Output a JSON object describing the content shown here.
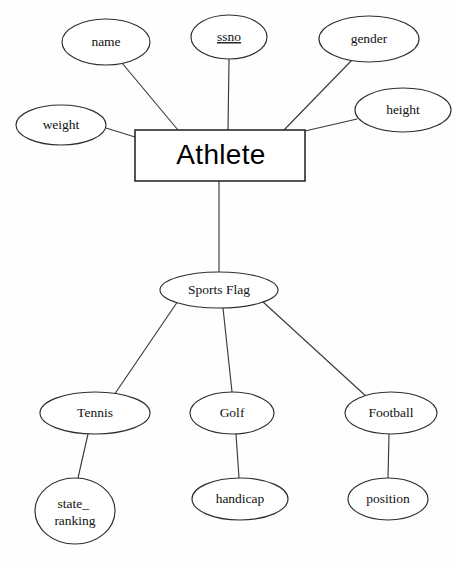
{
  "diagram": {
    "type": "entity-relationship-diagram",
    "background_color": "#fefefe",
    "line_color": "#3a3a3a",
    "node_fill": "#ffffff",
    "node_stroke": "#2e2e2e"
  },
  "entities": [
    {
      "id": "athlete",
      "label": "Athlete",
      "shape": "rectangle",
      "x": 135,
      "y": 130,
      "width": 170,
      "height": 51,
      "font": "sans-serif",
      "font_size": 28
    }
  ],
  "relationships": [
    {
      "id": "sports-flag",
      "label": "Sports Flag",
      "shape": "ellipse",
      "cx": 219,
      "cy": 290,
      "rx": 59,
      "ry": 18
    }
  ],
  "attributes": [
    {
      "id": "name",
      "label": "name",
      "parent": "athlete",
      "is_key": false,
      "cx": 106,
      "cy": 42,
      "rx": 44,
      "ry": 23
    },
    {
      "id": "ssno",
      "label": "ssno",
      "parent": "athlete",
      "is_key": true,
      "cx": 229,
      "cy": 37,
      "rx": 38,
      "ry": 22
    },
    {
      "id": "gender",
      "label": "gender",
      "parent": "athlete",
      "is_key": false,
      "cx": 369,
      "cy": 39,
      "rx": 50,
      "ry": 23
    },
    {
      "id": "weight",
      "label": "weight",
      "parent": "athlete",
      "is_key": false,
      "cx": 61,
      "cy": 125,
      "rx": 45,
      "ry": 20
    },
    {
      "id": "height",
      "label": "height",
      "parent": "athlete",
      "is_key": false,
      "cx": 403,
      "cy": 110,
      "rx": 48,
      "ry": 22
    }
  ],
  "sports": [
    {
      "id": "tennis",
      "label": "Tennis",
      "cx": 95,
      "cy": 413,
      "rx": 55,
      "ry": 21,
      "child": {
        "id": "state-ranking",
        "label_lines": [
          "state_",
          "ranking"
        ],
        "label": "state_ ranking",
        "cx": 75,
        "cy": 511,
        "rx": 40,
        "ry": 33
      }
    },
    {
      "id": "golf",
      "label": "Golf",
      "cx": 232,
      "cy": 413,
      "rx": 42,
      "ry": 21,
      "child": {
        "id": "handicap",
        "label_lines": [
          "handicap"
        ],
        "label": "handicap",
        "cx": 240,
        "cy": 499,
        "rx": 48,
        "ry": 21
      }
    },
    {
      "id": "football",
      "label": "Football",
      "cx": 391,
      "cy": 413,
      "rx": 46,
      "ry": 21,
      "child": {
        "id": "position",
        "label_lines": [
          "position"
        ],
        "label": "position",
        "cx": 388,
        "cy": 499,
        "rx": 40,
        "ry": 21
      }
    }
  ],
  "labels": {
    "athlete": "Athlete",
    "sports_flag": "Sports Flag",
    "name": "name",
    "ssno": "ssno",
    "gender": "gender",
    "weight": "weight",
    "height": "height",
    "tennis": "Tennis",
    "golf": "Golf",
    "football": "Football",
    "state_ranking_line1": "state_",
    "state_ranking_line2": "ranking",
    "handicap": "handicap",
    "position": "position"
  }
}
